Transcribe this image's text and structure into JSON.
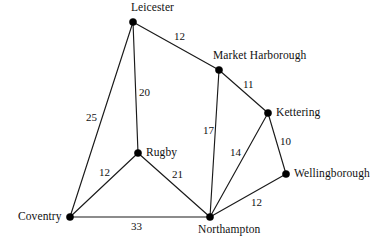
{
  "diagram": {
    "type": "undirected-weighted-graph",
    "background_color": "#ffffff",
    "line_color": "#1a1a1a",
    "node_color": "#000000",
    "text_color": "#111111"
  },
  "nodes": [
    {
      "id": "leicester",
      "label": "Leicester",
      "x": 133,
      "y": 22,
      "label_x": 131,
      "label_y": 2,
      "label_anchor": "center"
    },
    {
      "id": "market_harborough",
      "label": "Market Harborough",
      "x": 219,
      "y": 70,
      "label_x": 213,
      "label_y": 50,
      "label_anchor": "left"
    },
    {
      "id": "kettering",
      "label": "Kettering",
      "x": 268,
      "y": 113,
      "label_x": 276,
      "label_y": 107,
      "label_anchor": "left"
    },
    {
      "id": "wellingborough",
      "label": "Wellingborough",
      "x": 286,
      "y": 174,
      "label_x": 294,
      "label_y": 168,
      "label_anchor": "left"
    },
    {
      "id": "northampton",
      "label": "Northampton",
      "x": 210,
      "y": 217,
      "label_x": 198,
      "label_y": 224,
      "label_anchor": "center"
    },
    {
      "id": "coventry",
      "label": "Coventry",
      "x": 70,
      "y": 217,
      "label_x": 18,
      "label_y": 211,
      "label_anchor": "left"
    },
    {
      "id": "rugby",
      "label": "Rugby",
      "x": 138,
      "y": 153,
      "label_x": 146,
      "label_y": 147,
      "label_anchor": "left"
    }
  ],
  "edges": [
    {
      "id": "leicester-market_harborough",
      "from": "leicester",
      "to": "market_harborough",
      "weight": "12",
      "label_x": 174,
      "label_y": 31
    },
    {
      "id": "leicester-rugby",
      "from": "leicester",
      "to": "rugby",
      "weight": "20",
      "label_x": 139,
      "label_y": 87
    },
    {
      "id": "leicester-coventry",
      "from": "leicester",
      "to": "coventry",
      "weight": "25",
      "label_x": 86,
      "label_y": 112
    },
    {
      "id": "market_harborough-kettering",
      "from": "market_harborough",
      "to": "kettering",
      "weight": "11",
      "label_x": 243,
      "label_y": 79
    },
    {
      "id": "market_harborough-northampton",
      "from": "market_harborough",
      "to": "northampton",
      "weight": "17",
      "label_x": 203,
      "label_y": 125
    },
    {
      "id": "kettering-wellingborough",
      "from": "kettering",
      "to": "wellingborough",
      "weight": "10",
      "label_x": 280,
      "label_y": 136
    },
    {
      "id": "kettering-northampton",
      "from": "kettering",
      "to": "northampton",
      "weight": "14",
      "label_x": 230,
      "label_y": 147
    },
    {
      "id": "wellingborough-northampton",
      "from": "wellingborough",
      "to": "northampton",
      "weight": "12",
      "label_x": 251,
      "label_y": 197
    },
    {
      "id": "rugby-coventry",
      "from": "rugby",
      "to": "coventry",
      "weight": "12",
      "label_x": 99,
      "label_y": 167
    },
    {
      "id": "rugby-northampton",
      "from": "rugby",
      "to": "northampton",
      "weight": "21",
      "label_x": 172,
      "label_y": 169
    },
    {
      "id": "coventry-northampton",
      "from": "coventry",
      "to": "northampton",
      "weight": "33",
      "label_x": 131,
      "label_y": 221
    }
  ]
}
